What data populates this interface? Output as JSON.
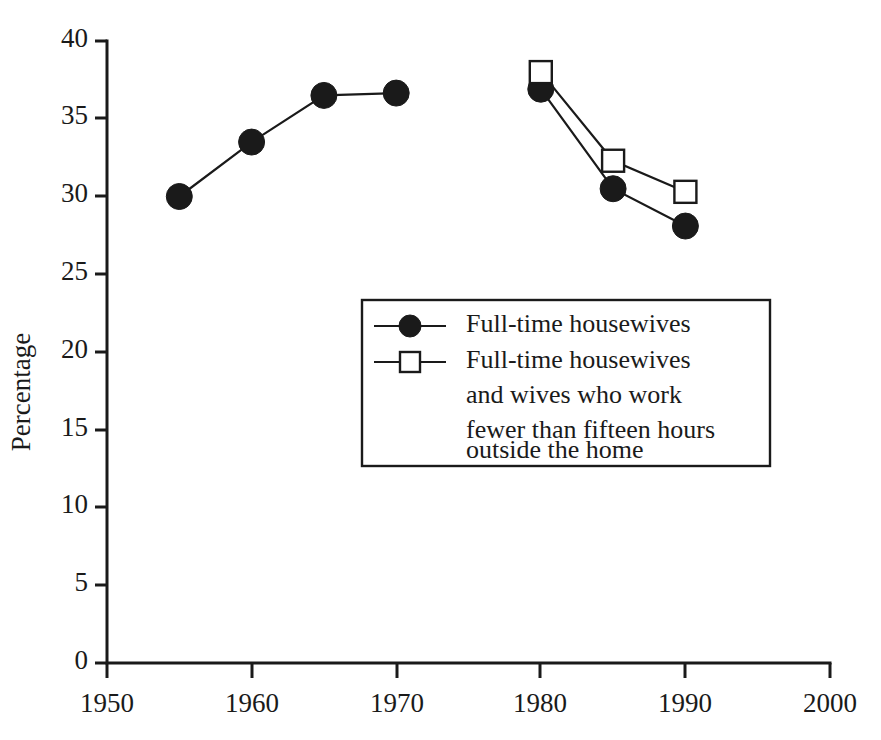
{
  "chart_data": {
    "type": "line",
    "title": "",
    "subtitle": "",
    "xlabel": "",
    "ylabel": "Percentage",
    "xlim": [
      1950,
      2000
    ],
    "ylim": [
      0,
      40
    ],
    "xticks": [
      1950,
      1960,
      1970,
      1980,
      1990,
      2000
    ],
    "xtick_labels": [
      "1950",
      "1960",
      "1970",
      "1980",
      "1990",
      "2000"
    ],
    "yticks": [
      0,
      5,
      10,
      15,
      20,
      25,
      30,
      35,
      40
    ],
    "ytick_labels": [
      "0",
      "5",
      "10",
      "15",
      "20",
      "25",
      "30",
      "35",
      "40"
    ],
    "grid": false,
    "legend_position": "center",
    "series": [
      {
        "name": "Full-time housewives",
        "marker": "filled-circle",
        "segments": [
          {
            "x": [
              1955,
              1960,
              1965,
              1970
            ],
            "y": [
              30.0,
              33.5,
              36.5,
              36.65
            ]
          },
          {
            "x": [
              1980,
              1985,
              1990
            ],
            "y": [
              36.9,
              30.5,
              28.1
            ]
          }
        ]
      },
      {
        "name": "Full-time housewives and wives who work fewer than fifteen hours outside the home",
        "marker": "open-square",
        "segments": [
          {
            "x": [
              1980,
              1985,
              1990
            ],
            "y": [
              38.0,
              32.3,
              30.3
            ]
          }
        ]
      }
    ]
  },
  "axes": {
    "y_title": "Percentage",
    "x_tick_labels": [
      "1950",
      "1960",
      "1970",
      "1980",
      "1990",
      "2000"
    ],
    "y_tick_labels": [
      "0",
      "5",
      "10",
      "15",
      "20",
      "25",
      "30",
      "35",
      "40"
    ]
  },
  "legend": {
    "entries": [
      {
        "marker": "filled-circle",
        "lines": [
          "Full-time housewives"
        ]
      },
      {
        "marker": "open-square",
        "lines": [
          "Full-time housewives",
          "and wives who work",
          "fewer than fifteen hours",
          "outside the home"
        ]
      }
    ]
  },
  "colors": {
    "ink": "#1a1a1a",
    "background": "#ffffff",
    "marker_fill": "#1a1a1a",
    "marker_open_fill": "#ffffff"
  }
}
